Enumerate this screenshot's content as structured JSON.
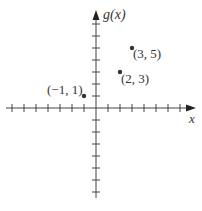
{
  "chart_data": {
    "type": "scatter",
    "title": "",
    "xlabel": "x",
    "ylabel": "g(x)",
    "xlim": [
      -7,
      8
    ],
    "ylim": [
      -8,
      8
    ],
    "grid": false,
    "x_ticks_count": {
      "negative": 7,
      "positive": 7
    },
    "y_ticks_count": {
      "negative": 7,
      "positive": 7
    },
    "points": [
      {
        "x": -1,
        "y": 1,
        "label": "(−1, 1)"
      },
      {
        "x": 2,
        "y": 3,
        "label": "(2, 3)"
      },
      {
        "x": 3,
        "y": 5,
        "label": "(3, 5)"
      }
    ],
    "colors": {
      "axis": "#444444",
      "point": "#333333"
    }
  },
  "labels": {
    "y_axis": "g(x)",
    "x_axis": "x",
    "p1": "(−1, 1)",
    "p2": "(2, 3)",
    "p3": "(3, 5)"
  }
}
